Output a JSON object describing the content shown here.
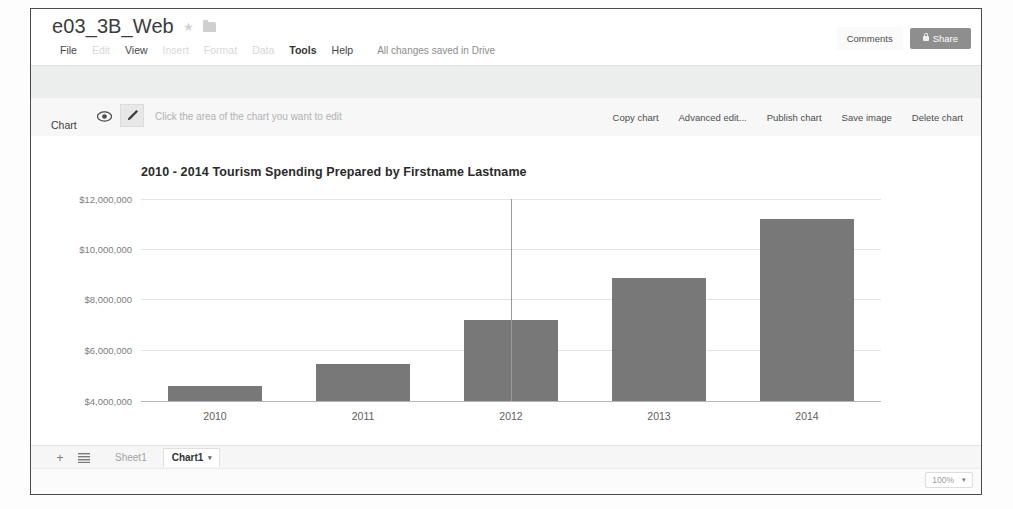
{
  "account": {
    "email_line": "dssfname lastname gr@gmail.com",
    "caret": "▾"
  },
  "document": {
    "title": "e03_3B_Web",
    "star_icon": "★",
    "folder_icon": "folder-icon"
  },
  "menubar": {
    "items": [
      {
        "label": "File",
        "state": "normal"
      },
      {
        "label": "Edit",
        "state": "faded"
      },
      {
        "label": "View",
        "state": "normal"
      },
      {
        "label": "Insert",
        "state": "faded"
      },
      {
        "label": "Format",
        "state": "faded"
      },
      {
        "label": "Data",
        "state": "faded"
      },
      {
        "label": "Tools",
        "state": "bold"
      },
      {
        "label": "Help",
        "state": "normal"
      }
    ],
    "save_status": "All changes saved in Drive"
  },
  "header_buttons": {
    "comments_label": "Comments",
    "share_label": "Share",
    "share_color": "#8e8e8e"
  },
  "chart_toolbar": {
    "chart_label": "Chart",
    "eye_icon": "eye-icon",
    "pencil_icon": "pencil-icon",
    "hint": "Click the area of the chart you want to edit",
    "actions": [
      "Copy chart",
      "Advanced edit...",
      "Publish chart",
      "Save image",
      "Delete chart"
    ]
  },
  "chart_data": {
    "type": "bar",
    "title": "2010 - 2014 Tourism Spending Prepared by Firstname Lastname",
    "xlabel": "",
    "ylabel": "",
    "categories": [
      "2010",
      "2011",
      "2012",
      "2013",
      "2014"
    ],
    "values": [
      4600000,
      5480000,
      7200000,
      8880000,
      11200000
    ],
    "ylim": [
      4000000,
      12000000
    ],
    "ytick_values": [
      12000000,
      10000000,
      8000000,
      6000000,
      4000000
    ],
    "ytick_labels": [
      "$12,000,000",
      "$10,000,000",
      "$8,000,000",
      "$6,000,000",
      "$4,000,000"
    ],
    "grid": true,
    "legend": false,
    "bar_color": "#787878",
    "selected_index": 2
  },
  "sheetbar": {
    "add_icon": "+",
    "all_sheets_icon": "list-icon",
    "tabs": [
      {
        "label": "Sheet1",
        "active": false
      },
      {
        "label": "Chart1",
        "active": true,
        "caret": "▾"
      }
    ]
  },
  "statusbar": {
    "zoom_label": "100%",
    "zoom_caret": "▾"
  }
}
